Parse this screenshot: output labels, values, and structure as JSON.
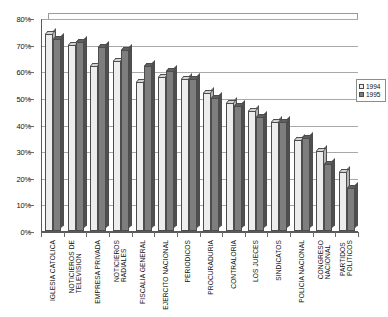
{
  "chart_data": {
    "type": "bar",
    "title": "",
    "subtitle": "",
    "xlabel": "",
    "ylabel": "",
    "ylim": [
      0,
      80
    ],
    "ytick_labels": [
      "0%",
      "10%",
      "20%",
      "30%",
      "40%",
      "50%",
      "60%",
      "70%",
      "80%"
    ],
    "ytick_values": [
      0,
      10,
      20,
      30,
      40,
      50,
      60,
      70,
      80
    ],
    "grid": true,
    "legend_position": "right",
    "categories": [
      "IGLESIA CATOLICA",
      "NOTICIEROS DE TELEVISION",
      "EMPRESA PRIVADA",
      "NOTICIEROS RADIALES",
      "FISCALIA GENERAL",
      "EJERCITO NACIONAL",
      "PERIODICOS",
      "PROCURADURIA",
      "CONTRALORIA",
      "LOS JUECES",
      "SINDICATOS",
      "POLICIA NACIONAL",
      "CONGRESO NACIONAL",
      "PARTIDOS POLITICOS"
    ],
    "series": [
      {
        "name": "1994",
        "color": "#ededed",
        "values": [
          74,
          70,
          62,
          64,
          56,
          58,
          57,
          52,
          48,
          45,
          41,
          34,
          30,
          22
        ]
      },
      {
        "name": "1995",
        "color": "#7e7e7e",
        "values": [
          72,
          71,
          69,
          68,
          62,
          60,
          57,
          50,
          47,
          43,
          41,
          35,
          25,
          16
        ]
      }
    ]
  },
  "legend": {
    "entries": [
      {
        "label": "1994",
        "swatch": "light-swatch"
      },
      {
        "label": "1995",
        "swatch": "dark-swatch"
      }
    ]
  }
}
